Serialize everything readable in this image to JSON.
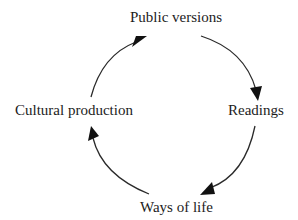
{
  "diagram": {
    "type": "cycle",
    "direction": "clockwise",
    "nodes": [
      {
        "id": "public_versions",
        "label": "Public versions",
        "position": "top"
      },
      {
        "id": "readings",
        "label": "Readings",
        "position": "right"
      },
      {
        "id": "ways_of_life",
        "label": "Ways of life",
        "position": "bottom"
      },
      {
        "id": "cultural_production",
        "label": "Cultural production",
        "position": "left"
      }
    ],
    "edges": [
      {
        "from": "public_versions",
        "to": "readings"
      },
      {
        "from": "readings",
        "to": "ways_of_life"
      },
      {
        "from": "ways_of_life",
        "to": "cultural_production"
      },
      {
        "from": "cultural_production",
        "to": "public_versions"
      }
    ],
    "colors": {
      "background": "#ffffff",
      "text": "#1c1c1c",
      "arrow": "#2a2a2a"
    }
  }
}
